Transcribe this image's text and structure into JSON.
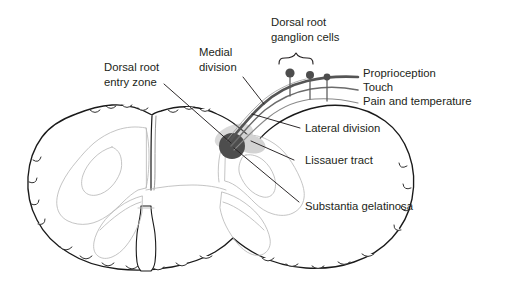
{
  "figure": {
    "background_color": "#ffffff",
    "text_color": "#231f20",
    "width": 509,
    "height": 285
  },
  "labels": {
    "dorsal_root_entry_zone_line1": "Dorsal root",
    "dorsal_root_entry_zone_line2": "entry zone",
    "medial_division_line1": "Medial",
    "medial_division_line2": "division",
    "ganglion_cells_line1": "Dorsal root",
    "ganglion_cells_line2": "ganglion cells",
    "proprioception": "Proprioception",
    "touch": "Touch",
    "pain_and_temperature": "Pain and temperature",
    "lateral_division": "Lateral division",
    "lissauer_tract": "Lissauer tract",
    "substantia_gelatinosa": "Substantia gelatinosa"
  },
  "structures": {
    "spinal_cord": "spinal-cord-cross-section",
    "gray_matter": "gray-matter-butterfly",
    "dorsal_median_septum": "dorsal-median-septum",
    "ventral_median_fissure": "ventral-median-fissure",
    "substantia_gelatinosa_marker": "substantia-gelatinosa-marker",
    "lissauer_tract_marker": "lissauer-tract-marker",
    "ganglion_cell_count": 3,
    "fiber_tract_count": 3
  },
  "colors": {
    "outline": "#1a1a1a",
    "gray_matter_outline": "#b9b9b9",
    "fiber_dark": "#555555",
    "fiber_mid": "#6b6b6b",
    "fiber_light": "#8a8a8a",
    "soma": "#4d4d4d",
    "substantia_gelatinosa": "#4d4d4d",
    "lissauer_tract": "#d3d3d3",
    "text": "#231f20"
  }
}
